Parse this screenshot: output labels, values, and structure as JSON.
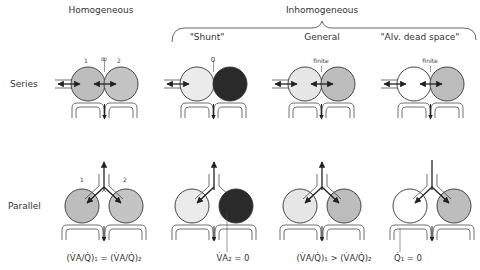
{
  "headers": {
    "homogeneous": "Homogeneous",
    "inhomogeneous": "Inhomogeneous"
  },
  "columns": [
    {
      "key": "homogeneous",
      "label": ""
    },
    {
      "key": "shunt",
      "label": "\"Shunt\""
    },
    {
      "key": "general",
      "label": "General"
    },
    {
      "key": "alv_dead_space",
      "label": "\"Alv. dead space\""
    }
  ],
  "rows": {
    "series": "Series",
    "parallel": "Parallel"
  },
  "series_annotations": {
    "homogeneous": {
      "unit1": "1",
      "unit2": "2",
      "interface": "∞"
    },
    "shunt": {
      "interface": "0"
    },
    "general": {
      "interface": "finite"
    },
    "alv_dead_space": {
      "interface": "finite"
    }
  },
  "parallel_annotations": {
    "homogeneous": {
      "unit1": "1",
      "unit2": "2"
    }
  },
  "formulas": {
    "homogeneous": "(V̇A/Q̇)₁ = (V̇A/Q̇)₂",
    "shunt": "V̇A₂ = 0",
    "general": "(V̇A/Q̇)₁ > (V̇A/Q̇)₂",
    "alv_dead_space": "Q̇₁ = 0"
  },
  "colors": {
    "gray_medium": "#bdbdbd",
    "gray_light": "#e6e6e6",
    "gray_dark": "#2a2a2a",
    "white": "#ffffff",
    "stroke": "#333333"
  }
}
